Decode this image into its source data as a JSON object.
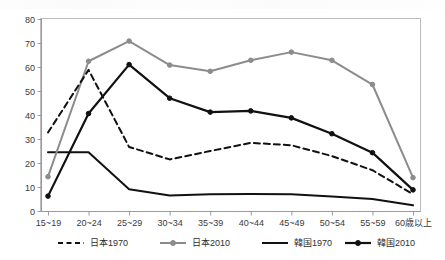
{
  "chart_data": {
    "type": "line",
    "title": "",
    "subtitle": "",
    "xlabel": "",
    "ylabel": "",
    "ylim": [
      0,
      80
    ],
    "ytick_step": 10,
    "yticks": [
      "0",
      "10",
      "20",
      "30",
      "40",
      "50",
      "60",
      "70",
      "80"
    ],
    "grid": false,
    "legend_position": "bottom",
    "categories": [
      "15~19",
      "20~24",
      "25~29",
      "30~34",
      "35~39",
      "40~44",
      "45~49",
      "50~54",
      "55~59",
      "60歳以上"
    ],
    "series": [
      {
        "name": "日本1970",
        "style": "dashed",
        "color": "#111111",
        "markers": false,
        "values": [
          32.7,
          58.8,
          26.7,
          21.5,
          25.0,
          28.4,
          27.4,
          22.9,
          17.0,
          7.0
        ]
      },
      {
        "name": "日本2010",
        "style": "solid",
        "color": "#8c8c8c",
        "markers": true,
        "values": [
          14.3,
          62.4,
          70.8,
          60.8,
          58.2,
          62.8,
          66.2,
          62.8,
          52.7,
          13.9
        ]
      },
      {
        "name": "韓国1970",
        "style": "solid",
        "color": "#111111",
        "markers": false,
        "values": [
          24.5,
          24.5,
          9.1,
          6.5,
          7.0,
          7.1,
          7.0,
          6.0,
          5.0,
          2.4
        ]
      },
      {
        "name": "韓国2010",
        "style": "solid",
        "color": "#111111",
        "markers": true,
        "values": [
          6.2,
          40.6,
          61.0,
          47.0,
          41.2,
          41.7,
          38.8,
          32.2,
          24.3,
          8.8
        ]
      }
    ]
  },
  "legend": {
    "items": [
      {
        "label": "日本1970"
      },
      {
        "label": "日本2010"
      },
      {
        "label": "韓国1970"
      },
      {
        "label": "韓国2010"
      }
    ]
  }
}
